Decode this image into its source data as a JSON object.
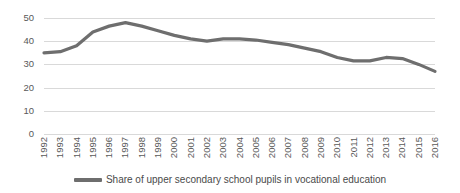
{
  "chart_data": {
    "type": "line",
    "title": "",
    "xlabel": "",
    "ylabel": "",
    "grid": true,
    "legend_position": "bottom",
    "ylim": [
      0,
      50
    ],
    "yticks": [
      0,
      10,
      20,
      30,
      40,
      50
    ],
    "categories": [
      "1992",
      "1993",
      "1994",
      "1995",
      "1996",
      "1997",
      "1998",
      "1999",
      "2000",
      "2001",
      "2002",
      "2003",
      "2004",
      "2005",
      "2006",
      "2007",
      "2008",
      "2009",
      "2010",
      "2011",
      "2012",
      "2013",
      "2014",
      "2015",
      "2016"
    ],
    "series": [
      {
        "name": "Share of upper secondary school pupils in vocational education",
        "color": "#6e6e6e",
        "values": [
          35,
          35.5,
          38,
          44,
          46.5,
          48,
          46.5,
          44.5,
          42.5,
          41,
          40,
          41,
          41,
          40.5,
          39.5,
          38.5,
          37,
          35.5,
          33,
          31.5,
          31.5,
          33,
          32.5,
          30,
          27
        ]
      }
    ]
  },
  "legend": {
    "entries": [
      {
        "label": "Share of upper secondary school pupils in vocational education"
      }
    ]
  }
}
